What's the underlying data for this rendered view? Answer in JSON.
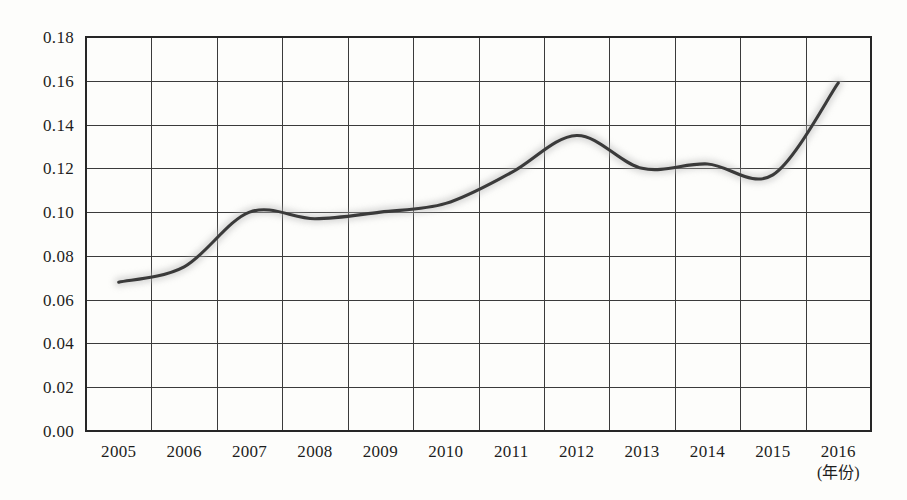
{
  "chart_data": {
    "type": "line",
    "title": "",
    "subtitle": "",
    "xlabel": "(年份)",
    "ylabel": "",
    "grid": true,
    "legend": null,
    "legend_position": "none",
    "xlim": [
      2005,
      2016
    ],
    "ylim": [
      0.0,
      0.18
    ],
    "ytick_step": 0.02,
    "categories": [
      "2005",
      "2006",
      "2007",
      "2008",
      "2009",
      "2010",
      "2011",
      "2012",
      "2013",
      "2014",
      "2015",
      "2016"
    ],
    "x": [
      2005,
      2006,
      2007,
      2008,
      2009,
      2010,
      2011,
      2012,
      2013,
      2014,
      2015,
      2016
    ],
    "values": [
      0.068,
      0.075,
      0.1,
      0.097,
      0.1,
      0.104,
      0.118,
      0.135,
      0.12,
      0.122,
      0.117,
      0.159
    ],
    "series": [
      {
        "name": "ratio",
        "values": [
          0.068,
          0.075,
          0.1,
          0.097,
          0.1,
          0.104,
          0.118,
          0.135,
          0.12,
          0.122,
          0.117,
          0.159
        ]
      }
    ],
    "ytick_labels": [
      "0.00",
      "0.02",
      "0.04",
      "0.06",
      "0.08",
      "0.10",
      "0.12",
      "0.14",
      "0.16",
      "0.18"
    ],
    "ytick_values": [
      0.0,
      0.02,
      0.04,
      0.06,
      0.08,
      0.1,
      0.12,
      0.14,
      0.16,
      0.18
    ],
    "line_color": "#3a3a3a",
    "grid_color": "#3b3b3b",
    "frame_color": "#262626",
    "background_color": "#fdfdfb"
  }
}
